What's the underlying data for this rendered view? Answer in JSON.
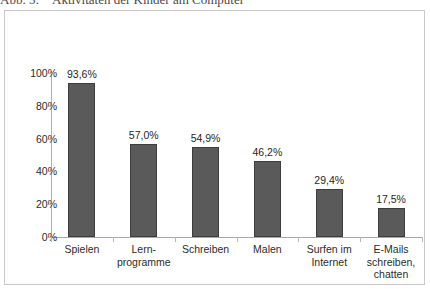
{
  "caption": {
    "number": "Abb. 3:",
    "text": "Aktivitäten der Kinder am Computer"
  },
  "chart_data": {
    "type": "bar",
    "title": "Aktivitäten der Kinder am Computer",
    "xlabel": "",
    "ylabel": "",
    "ylim": [
      0,
      100
    ],
    "yticks": [
      "0%",
      "20%",
      "40%",
      "60%",
      "80%",
      "100%"
    ],
    "ytick_values": [
      0,
      20,
      40,
      60,
      80,
      100
    ],
    "grid": false,
    "legend": "none",
    "bar_color": "#5a5a5a",
    "bar_border_color": "#3d3d3d",
    "categories": [
      [
        "Spielen"
      ],
      [
        "Lern-",
        "programme"
      ],
      [
        "Schreiben"
      ],
      [
        "Malen"
      ],
      [
        "Surfen im",
        "Internet"
      ],
      [
        "E-Mails",
        "schreiben,",
        "chatten"
      ]
    ],
    "values": [
      93.6,
      57.0,
      54.9,
      46.2,
      29.4,
      17.5
    ],
    "value_labels": [
      "93,6%",
      "57,0%",
      "54,9%",
      "46,2%",
      "29,4%",
      "17,5%"
    ]
  }
}
